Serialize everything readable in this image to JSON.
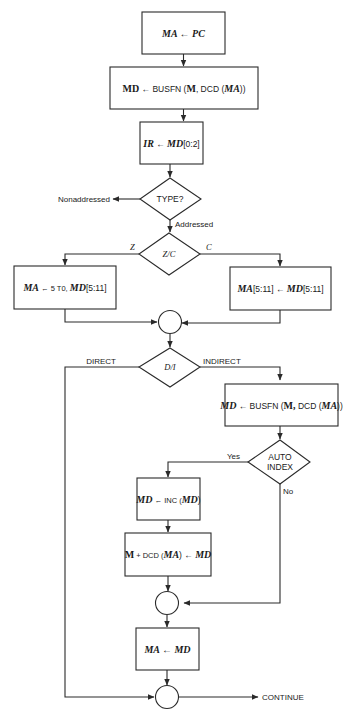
{
  "flowchart": {
    "box1": "MA ← PC",
    "box2": {
      "a": "MD",
      "b": " ← BUSFN (",
      "c": "M",
      "d": ", DCD (",
      "e": "MA",
      "f": "))"
    },
    "box3": {
      "a": "IR",
      "b": " ← ",
      "c": "MD",
      "d": "[0:2]"
    },
    "decision_type": "TYPE?",
    "nonaddressed": "Nonaddressed",
    "addressed": "Addressed",
    "decision_zc": "Z/C",
    "label_z": "Z",
    "label_c": "C",
    "box_z": {
      "a": "MA",
      "b": " ← 5 T0, ",
      "c": "MD",
      "d": "[5:11]"
    },
    "box_c": {
      "a": "MA",
      "b": "[5:11] ← ",
      "c": "MD",
      "d": "[5:11]"
    },
    "decision_di": "D/I",
    "label_direct": "DIRECT",
    "label_indirect": "INDIRECT",
    "box_indirect": {
      "a": "MD",
      "b": " ← BUSFN (",
      "c": "M,",
      "d": " DCD (",
      "e": "MA",
      "f": "))"
    },
    "decision_auto_1": "AUTO",
    "decision_auto_2": "INDEX",
    "label_yes": "Yes",
    "label_no": "No",
    "box_inc": {
      "a": "MD",
      "b": " ← INC (",
      "c": "MD",
      "d": ")"
    },
    "box_store": {
      "a": "M",
      "b": " + DCD (",
      "c": "MA",
      "d": ") ← ",
      "e": "MD"
    },
    "box_mamd": "MA ← MD",
    "continue": "CONTINUE"
  }
}
